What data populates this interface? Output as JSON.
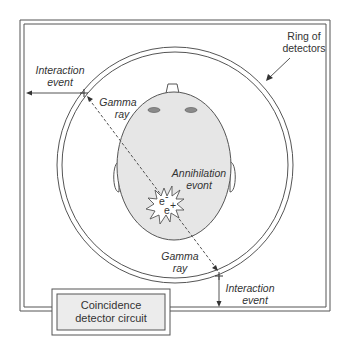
{
  "diagram": {
    "labels": {
      "ring_of_detectors_line1": "Ring of",
      "ring_of_detectors_line2": "detectors",
      "interaction_event_top_line1": "Interaction",
      "interaction_event_top_line2": "event",
      "gamma_ray_top_line1": "Gamma",
      "gamma_ray_top_line2": "ray",
      "annihilation_line1": "Annihilation",
      "annihilation_line2": "evont",
      "electron": "e",
      "positron": "e",
      "electron_sup": "-",
      "positron_sup": "+",
      "gamma_ray_bottom_line1": "Gamma",
      "gamma_ray_bottom_line2": "ray",
      "interaction_event_bottom_line1": "Interaction",
      "interaction_event_bottom_line2": "event",
      "coincidence_line1": "Coincidence",
      "coincidence_line2": "detector circuit"
    },
    "colors": {
      "line": "#555555",
      "head_fill": "#e6e6e6",
      "eye_fill": "#8a8a8a",
      "box_fill": "#ececec",
      "background": "#ffffff"
    }
  }
}
